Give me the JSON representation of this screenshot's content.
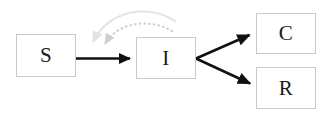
{
  "diagram": {
    "type": "flow-diagram",
    "canvas": {
      "width": 332,
      "height": 121,
      "background": "#ffffff"
    },
    "nodes": [
      {
        "id": "s",
        "label": "S",
        "x": 16,
        "y": 34,
        "width": 60,
        "height": 43,
        "border_color": "#c9c9c9",
        "fill": "#ffffff"
      },
      {
        "id": "i",
        "label": "I",
        "x": 136,
        "y": 37,
        "width": 60,
        "height": 42,
        "border_color": "#c9c9c9",
        "fill": "#ffffff"
      },
      {
        "id": "c",
        "label": "C",
        "x": 256,
        "y": 13,
        "width": 60,
        "height": 41,
        "border_color": "#c9c9c9",
        "fill": "#ffffff"
      },
      {
        "id": "r",
        "label": "R",
        "x": 256,
        "y": 67,
        "width": 60,
        "height": 42,
        "border_color": "#c9c9c9",
        "fill": "#ffffff"
      }
    ],
    "edges": [
      {
        "id": "s-to-i",
        "from": "S",
        "to": "I",
        "style": "solid",
        "color": "#111111",
        "shape": "straight",
        "arrowhead": true
      },
      {
        "id": "i-to-c",
        "from": "I",
        "to": "C",
        "style": "solid",
        "color": "#111111",
        "shape": "straight",
        "arrowhead": true
      },
      {
        "id": "i-to-r",
        "from": "I",
        "to": "R",
        "style": "solid",
        "color": "#111111",
        "shape": "straight",
        "arrowhead": true
      },
      {
        "id": "i-to-s-outer",
        "from": "I",
        "to": "S",
        "style": "solid",
        "color": "#e2e2e2",
        "shape": "curved",
        "arrowhead": true
      },
      {
        "id": "i-to-s-inner",
        "from": "I",
        "to": "S",
        "style": "dotted",
        "color": "#cfcfcf",
        "shape": "curved",
        "arrowhead": true
      }
    ]
  }
}
